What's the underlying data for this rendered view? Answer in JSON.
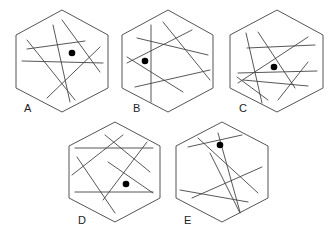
{
  "figure": {
    "width": 335,
    "height": 237,
    "background": "#ffffff",
    "line_color": "#444444",
    "dot_color": "#000000",
    "options": [
      {
        "label": "A",
        "hexagon": [
          [
            62,
            10
          ],
          [
            108,
            35
          ],
          [
            108,
            88
          ],
          [
            62,
            112
          ],
          [
            16,
            88
          ],
          [
            16,
            35
          ]
        ],
        "label_pos": [
          24,
          112
        ],
        "lines": [
          [
            27,
            40,
            75,
            100
          ],
          [
            53,
            25,
            70,
            102
          ],
          [
            62,
            20,
            100,
            72
          ],
          [
            27,
            49,
            85,
            41
          ],
          [
            22,
            61,
            103,
            63
          ],
          [
            47,
            98,
            100,
            47
          ]
        ],
        "dot": [
          72,
          53
        ]
      },
      {
        "label": "B",
        "hexagon": [
          [
            168,
            10
          ],
          [
            213,
            35
          ],
          [
            213,
            88
          ],
          [
            168,
            112
          ],
          [
            122,
            88
          ],
          [
            122,
            35
          ]
        ],
        "label_pos": [
          133,
          112
        ],
        "lines": [
          [
            151,
            25,
            151,
            102
          ],
          [
            137,
            38,
            208,
            55
          ],
          [
            163,
            22,
            210,
            80
          ],
          [
            127,
            63,
            192,
            30
          ],
          [
            127,
            57,
            183,
            92
          ],
          [
            135,
            87,
            210,
            70
          ]
        ],
        "dot": [
          145,
          61
        ]
      },
      {
        "label": "C",
        "hexagon": [
          [
            277,
            10
          ],
          [
            323,
            35
          ],
          [
            323,
            88
          ],
          [
            277,
            112
          ],
          [
            230,
            88
          ],
          [
            230,
            35
          ]
        ],
        "label_pos": [
          239,
          112
        ],
        "lines": [
          [
            246,
            33,
            262,
            103
          ],
          [
            258,
            32,
            295,
            88
          ],
          [
            247,
            48,
            315,
            45
          ],
          [
            238,
            83,
            308,
            37
          ],
          [
            238,
            73,
            317,
            71
          ],
          [
            237,
            77,
            268,
            100
          ],
          [
            243,
            80,
            308,
            86
          ],
          [
            278,
            100,
            308,
            62
          ]
        ],
        "dot": [
          274,
          67
        ]
      },
      {
        "label": "D",
        "hexagon": [
          [
            115,
            122
          ],
          [
            160,
            146
          ],
          [
            160,
            198
          ],
          [
            115,
            222
          ],
          [
            69,
            198
          ],
          [
            69,
            146
          ]
        ],
        "label_pos": [
          78,
          224
        ],
        "lines": [
          [
            75,
            148,
            153,
            148
          ],
          [
            75,
            192,
            153,
            192
          ],
          [
            72,
            175,
            123,
            135
          ],
          [
            77,
            157,
            115,
            213
          ],
          [
            105,
            135,
            150,
            172
          ],
          [
            108,
            162,
            153,
            193
          ],
          [
            103,
            200,
            147,
            142
          ]
        ],
        "dot": [
          126,
          184
        ]
      },
      {
        "label": "E",
        "hexagon": [
          [
            222,
            122
          ],
          [
            268,
            146
          ],
          [
            268,
            198
          ],
          [
            222,
            222
          ],
          [
            176,
            198
          ],
          [
            176,
            146
          ]
        ],
        "label_pos": [
          184,
          224
        ],
        "lines": [
          [
            188,
            147,
            242,
            135
          ],
          [
            198,
            138,
            258,
            193
          ],
          [
            218,
            133,
            240,
            212
          ],
          [
            210,
            153,
            240,
            213
          ],
          [
            192,
            198,
            262,
            167
          ],
          [
            180,
            190,
            248,
            202
          ]
        ],
        "dot": [
          220,
          145
        ]
      }
    ]
  }
}
